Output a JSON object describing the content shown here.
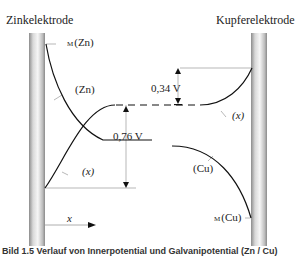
{
  "labels": {
    "zinc_electrode": "Zinkelektrode",
    "copper_electrode": "Kupferelektrode",
    "phi_m_zn_sub": "M",
    "phi_m_zn": "(Zn)",
    "phi_zn": "(Zn)",
    "phi_x_left": "(x)",
    "phi_x_right": "(x)",
    "phi_cu": "(Cu)",
    "phi_m_cu_sub": "M",
    "phi_m_cu": "(Cu)",
    "voltage_zn": "0,76 V",
    "voltage_cu": "0,34 V",
    "x_axis": "x"
  },
  "caption": "Bild 1.5 Verlauf von Innerpotential und Galvanipotential (Zn / Cu)",
  "colors": {
    "curve": "#111111",
    "guide": "#999999",
    "electrode_light": "#f4f4f4",
    "electrode_dark": "#9a9a9a"
  }
}
